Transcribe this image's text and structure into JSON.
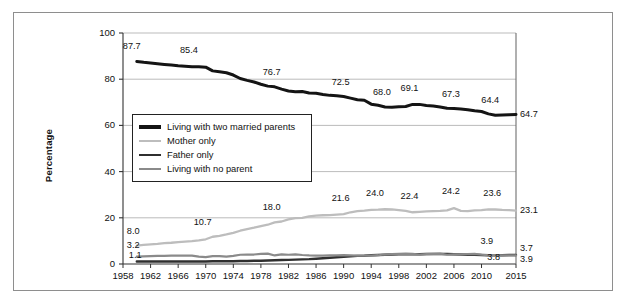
{
  "chart_data": {
    "type": "line",
    "title": "",
    "xlabel": "",
    "ylabel": "Percentage",
    "xlim": [
      1958,
      2015
    ],
    "ylim": [
      0,
      100
    ],
    "yticks": [
      0,
      20,
      40,
      60,
      80,
      100
    ],
    "xticks": [
      1958,
      1962,
      1966,
      1970,
      1974,
      1978,
      1982,
      1986,
      1990,
      1994,
      1998,
      2002,
      2006,
      2010,
      2015
    ],
    "grid": "horizontal",
    "legend_position": "center-left",
    "series": [
      {
        "name": "Living with two married parents",
        "color": "#141414",
        "x": [
          1960,
          1961,
          1962,
          1963,
          1964,
          1965,
          1966,
          1967,
          1968,
          1969,
          1970,
          1971,
          1972,
          1973,
          1974,
          1975,
          1976,
          1977,
          1978,
          1979,
          1980,
          1981,
          1982,
          1983,
          1984,
          1985,
          1986,
          1987,
          1988,
          1989,
          1990,
          1991,
          1992,
          1993,
          1994,
          1995,
          1996,
          1997,
          1998,
          1999,
          2000,
          2001,
          2002,
          2003,
          2004,
          2005,
          2006,
          2007,
          2008,
          2009,
          2010,
          2011,
          2012,
          2013,
          2014,
          2015
        ],
        "values": [
          87.7,
          87.3,
          87.0,
          86.7,
          86.4,
          86.1,
          85.8,
          85.6,
          85.4,
          85.4,
          85.2,
          83.6,
          83.2,
          82.8,
          81.8,
          80.3,
          79.5,
          78.8,
          77.8,
          77.0,
          76.7,
          75.7,
          74.9,
          74.6,
          74.7,
          74.0,
          73.9,
          73.4,
          73.0,
          72.8,
          72.5,
          71.8,
          71.1,
          70.9,
          69.2,
          68.7,
          68.0,
          67.9,
          68.1,
          68.2,
          69.1,
          69.1,
          68.6,
          68.4,
          68.0,
          67.4,
          67.3,
          67.1,
          66.8,
          66.3,
          66.0,
          65.0,
          64.4,
          64.5,
          64.6,
          64.7
        ]
      },
      {
        "name": "Mother only",
        "color": "#bdbdbd",
        "x": [
          1960,
          1961,
          1962,
          1963,
          1964,
          1965,
          1966,
          1967,
          1968,
          1969,
          1970,
          1971,
          1972,
          1973,
          1974,
          1975,
          1976,
          1977,
          1978,
          1979,
          1980,
          1981,
          1982,
          1983,
          1984,
          1985,
          1986,
          1987,
          1988,
          1989,
          1990,
          1991,
          1992,
          1993,
          1994,
          1995,
          1996,
          1997,
          1998,
          1999,
          2000,
          2001,
          2002,
          2003,
          2004,
          2005,
          2006,
          2007,
          2008,
          2009,
          2010,
          2011,
          2012,
          2013,
          2014,
          2015
        ],
        "values": [
          8.0,
          8.3,
          8.5,
          8.7,
          9.0,
          9.2,
          9.5,
          9.7,
          9.9,
          10.2,
          10.7,
          11.8,
          12.2,
          12.8,
          13.5,
          14.4,
          15.1,
          15.7,
          16.4,
          17.0,
          18.0,
          18.4,
          19.3,
          19.9,
          20.0,
          20.6,
          20.9,
          21.1,
          21.2,
          21.4,
          21.6,
          22.4,
          22.9,
          23.1,
          23.4,
          23.5,
          23.7,
          23.6,
          23.3,
          23.0,
          22.4,
          22.6,
          22.8,
          22.9,
          23.0,
          23.2,
          24.2,
          23.0,
          22.9,
          23.2,
          23.3,
          23.6,
          23.6,
          23.4,
          23.3,
          23.1
        ]
      },
      {
        "name": "Father only",
        "color": "#2f2f2f",
        "x": [
          1960,
          1961,
          1962,
          1963,
          1964,
          1965,
          1966,
          1967,
          1968,
          1969,
          1970,
          1971,
          1972,
          1973,
          1974,
          1975,
          1976,
          1977,
          1978,
          1979,
          1980,
          1981,
          1982,
          1983,
          1984,
          1985,
          1986,
          1987,
          1988,
          1989,
          1990,
          1991,
          1992,
          1993,
          1994,
          1995,
          1996,
          1997,
          1998,
          1999,
          2000,
          2001,
          2002,
          2003,
          2004,
          2005,
          2006,
          2007,
          2008,
          2009,
          2010,
          2011,
          2012,
          2013,
          2014,
          2015
        ],
        "values": [
          1.1,
          1.1,
          1.1,
          1.1,
          1.1,
          1.1,
          1.1,
          1.1,
          1.1,
          1.1,
          1.1,
          1.2,
          1.2,
          1.2,
          1.2,
          1.3,
          1.3,
          1.4,
          1.4,
          1.5,
          1.6,
          1.7,
          1.8,
          1.9,
          2.0,
          2.1,
          2.3,
          2.5,
          2.7,
          2.9,
          3.1,
          3.3,
          3.5,
          3.6,
          3.8,
          3.9,
          4.0,
          4.1,
          4.2,
          4.2,
          4.2,
          4.2,
          4.3,
          4.3,
          4.4,
          4.3,
          4.2,
          4.1,
          4.0,
          4.0,
          3.9,
          3.8,
          3.8,
          3.8,
          3.9,
          3.9
        ]
      },
      {
        "name": "Living with no parent",
        "color": "#8a8a8a",
        "x": [
          1960,
          1961,
          1962,
          1963,
          1964,
          1965,
          1966,
          1967,
          1968,
          1969,
          1970,
          1971,
          1972,
          1973,
          1974,
          1975,
          1976,
          1977,
          1978,
          1979,
          1980,
          1981,
          1982,
          1983,
          1984,
          1985,
          1986,
          1987,
          1988,
          1989,
          1990,
          1991,
          1992,
          1993,
          1994,
          1995,
          1996,
          1997,
          1998,
          1999,
          2000,
          2001,
          2002,
          2003,
          2004,
          2005,
          2006,
          2007,
          2008,
          2009,
          2010,
          2011,
          2012,
          2013,
          2014,
          2015
        ],
        "values": [
          3.2,
          3.3,
          3.4,
          3.5,
          3.5,
          3.6,
          3.6,
          3.6,
          3.6,
          3.2,
          3.0,
          3.4,
          3.4,
          3.2,
          3.5,
          4.0,
          4.1,
          4.1,
          4.4,
          4.5,
          3.7,
          4.2,
          4.0,
          4.2,
          3.9,
          3.7,
          3.6,
          3.6,
          3.7,
          3.7,
          3.8,
          3.7,
          3.6,
          3.6,
          3.6,
          3.8,
          4.1,
          4.3,
          4.4,
          4.5,
          4.4,
          4.1,
          4.3,
          4.4,
          4.5,
          4.0,
          4.2,
          4.2,
          4.3,
          4.4,
          4.0,
          3.8,
          3.8,
          3.7,
          3.7,
          3.7
        ]
      }
    ],
    "point_labels": [
      {
        "series": "Living with two married parents",
        "text": "87.7",
        "x": 1960,
        "y": 87.7
      },
      {
        "series": "Living with two married parents",
        "text": "85.4",
        "x": 1968,
        "y": 85.4
      },
      {
        "series": "Living with two married parents",
        "text": "76.7",
        "x": 1980,
        "y": 76.7
      },
      {
        "series": "Living with two married parents",
        "text": "72.5",
        "x": 1990,
        "y": 72.5
      },
      {
        "series": "Living with two married parents",
        "text": "68.0",
        "x": 1996,
        "y": 68.0
      },
      {
        "series": "Living with two married parents",
        "text": "69.1",
        "x": 2000,
        "y": 69.1
      },
      {
        "series": "Living with two married parents",
        "text": "67.3",
        "x": 2006,
        "y": 67.3
      },
      {
        "series": "Living with two married parents",
        "text": "64.4",
        "x": 2012,
        "y": 64.4
      },
      {
        "series": "Mother only",
        "text": "8.0",
        "x": 1960,
        "y": 8.0
      },
      {
        "series": "Mother only",
        "text": "10.7",
        "x": 1970,
        "y": 10.7
      },
      {
        "series": "Mother only",
        "text": "18.0",
        "x": 1980,
        "y": 18.0
      },
      {
        "series": "Mother only",
        "text": "21.6",
        "x": 1990,
        "y": 21.6
      },
      {
        "series": "Mother only",
        "text": "24.0",
        "x": 1995,
        "y": 24.0
      },
      {
        "series": "Mother only",
        "text": "22.4",
        "x": 2000,
        "y": 22.4
      },
      {
        "series": "Mother only",
        "text": "24.2",
        "x": 2006,
        "y": 24.2
      },
      {
        "series": "Mother only",
        "text": "23.6",
        "x": 2012,
        "y": 23.6
      },
      {
        "series": "Living with no parent",
        "text": "3.2",
        "x": 1960,
        "y": 3.2
      },
      {
        "series": "Father only",
        "text": "1.1",
        "x": 1960,
        "y": 1.1
      },
      {
        "series": "Living with no parent",
        "text": "3.9",
        "x": 2011,
        "y": 3.9
      },
      {
        "series": "Father only",
        "text": "3.8",
        "x": 2012,
        "y": 3.8
      }
    ],
    "end_labels": [
      {
        "series": "Living with two married parents",
        "text": "64.7"
      },
      {
        "series": "Mother only",
        "text": "23.1"
      },
      {
        "series": "Living with no parent",
        "text": "3.7"
      },
      {
        "series": "Father only",
        "text": "3.9"
      }
    ]
  },
  "axis": {
    "ylabel": "Percentage",
    "yticks": [
      "100",
      "80",
      "60",
      "40",
      "20",
      "0"
    ],
    "xticks": [
      "1958",
      "1962",
      "1966",
      "1970",
      "1974",
      "1978",
      "1982",
      "1986",
      "1990",
      "1994",
      "1998",
      "2002",
      "2006",
      "2010",
      "2015"
    ]
  },
  "legend": {
    "items": [
      {
        "label": "Living with two married parents",
        "swatch": "sw-black"
      },
      {
        "label": "Mother only",
        "swatch": "sw-lgray"
      },
      {
        "label": "Father only",
        "swatch": "sw-dgray"
      },
      {
        "label": "Living with no parent",
        "swatch": "sw-mgray"
      }
    ]
  }
}
